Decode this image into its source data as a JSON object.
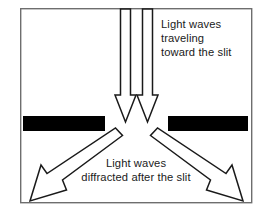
{
  "diagram": {
    "frame": {
      "x": 20,
      "y": 8,
      "width": 232,
      "height": 195,
      "stroke_color": "#6e6e6e",
      "fill_color": "#ffffff"
    },
    "barriers": [
      {
        "name": "left-barrier",
        "x": 23,
        "y": 116,
        "width": 82,
        "height": 15,
        "color": "#000000"
      },
      {
        "name": "right-barrier",
        "x": 168,
        "y": 116,
        "width": 80,
        "height": 15,
        "color": "#000000"
      }
    ],
    "slit": {
      "label": "slit",
      "center_x": 136,
      "gap_left": 105,
      "gap_right": 168
    },
    "incoming_arrows": [
      {
        "name": "incoming-arrow-left",
        "direction": "down",
        "shaft_x": 125.5,
        "tip_y": 122
      },
      {
        "name": "incoming-arrow-right",
        "direction": "down",
        "shaft_x": 147.5,
        "tip_y": 122
      }
    ],
    "diffracted_arrows": [
      {
        "name": "diffracted-arrow-left",
        "direction": "down-left",
        "tip_x": 30,
        "tip_y": 201
      },
      {
        "name": "diffracted-arrow-right",
        "direction": "down-right",
        "tip_x": 243,
        "tip_y": 201
      }
    ],
    "labels": {
      "incoming": {
        "name": "incoming-label",
        "align": "left",
        "x": 161,
        "lines": [
          {
            "text": "Light waves",
            "y": 28
          },
          {
            "text": "traveling",
            "y": 42
          },
          {
            "text": "toward the slit",
            "y": 56
          }
        ]
      },
      "diffracted": {
        "name": "diffracted-label",
        "align": "center",
        "x": 136,
        "lines": [
          {
            "text": "Light waves",
            "y": 167
          },
          {
            "text": "diffracted after the slit",
            "y": 181
          }
        ]
      }
    },
    "colors": {
      "ink": "#1a1a1a",
      "barrier": "#000000",
      "frame": "#6e6e6e",
      "background": "#ffffff"
    }
  }
}
